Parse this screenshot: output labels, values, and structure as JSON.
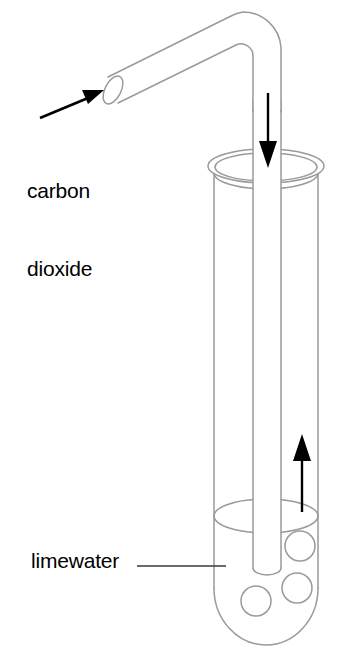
{
  "diagram": {
    "canvas": {
      "width": 353,
      "height": 663,
      "background": "#ffffff"
    },
    "colors": {
      "glass_outline": "#9a9a9a",
      "arrow_black": "#000000",
      "leader_line": "#3a3a3a",
      "text": "#000000",
      "fill_white": "#ffffff"
    },
    "labels": [
      {
        "name": "carbon-dioxide",
        "line1": "carbon",
        "line2": "dioxide",
        "pointer": "arrow",
        "points_to": "open end of delivery tube"
      },
      {
        "name": "limewater",
        "line1": "limewater",
        "pointer": "leader-line",
        "points_to": "liquid inside test tube"
      }
    ],
    "flow_arrows": [
      {
        "name": "gas-inflow-arrow",
        "direction": "down",
        "meaning": "carbon dioxide flowing down the delivery tube"
      },
      {
        "name": "gas-outflow-arrow",
        "direction": "up",
        "meaning": "gas rising out of the limewater"
      }
    ],
    "apparatus": {
      "test_tube": {
        "name": "test-tube",
        "contents": "limewater"
      },
      "delivery_tube": {
        "name": "delivery-tube",
        "shape": "bent glass tube"
      },
      "bubbles": {
        "name": "gas-bubbles",
        "count": 3
      }
    }
  }
}
